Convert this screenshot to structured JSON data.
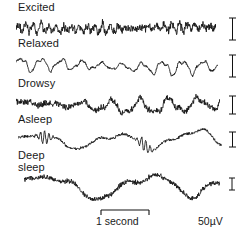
{
  "figure": {
    "width": 248,
    "height": 236,
    "background": "#ffffff",
    "trace_color": "#121212"
  },
  "traces": [
    {
      "label": "Excited",
      "state": "excited",
      "label_x": 18,
      "label_y": 2,
      "trace_x": 16,
      "trace_y": 18,
      "trace_width": 200,
      "trace_height": 20,
      "amplitude": 3.0,
      "frequency": 26,
      "noise": 1.9,
      "seed": 11,
      "rhythm": "beta",
      "description": "low-voltage fast beta activity",
      "vbar": {
        "x": 228,
        "y": 17,
        "height": 22,
        "cap_width": 7
      }
    },
    {
      "label": "Relaxed",
      "state": "relaxed",
      "label_x": 18,
      "label_y": 38,
      "trace_x": 16,
      "trace_y": 54,
      "trace_width": 202,
      "trace_height": 24,
      "amplitude": 8.0,
      "frequency": 10,
      "noise": 0.9,
      "seed": 27,
      "rhythm": "alpha",
      "description": "regular alpha rhythm",
      "vbar": {
        "x": 228,
        "y": 54,
        "height": 22,
        "cap_width": 7
      }
    },
    {
      "label": "Drowsy",
      "state": "drowsy",
      "label_x": 18,
      "label_y": 78,
      "trace_x": 16,
      "trace_y": 93,
      "trace_width": 204,
      "trace_height": 24,
      "amplitude": 5.0,
      "frequency": 7,
      "noise": 1.3,
      "seed": 43,
      "rhythm": "theta",
      "description": "mixed theta with waning alpha",
      "vbar": {
        "x": 228,
        "y": 95,
        "height": 18,
        "cap_width": 7
      }
    },
    {
      "label": "Asleep",
      "state": "asleep",
      "label_x": 18,
      "label_y": 114,
      "trace_x": 18,
      "trace_y": 126,
      "trace_width": 204,
      "trace_height": 28,
      "amplitude": 6.0,
      "frequency": 2.6,
      "noise": 0.8,
      "seed": 61,
      "rhythm": "spindles",
      "description": "slow waves with sleep spindles",
      "spindles": [
        0.13,
        0.62
      ],
      "vbar": {
        "x": 228,
        "y": 131,
        "height": 15,
        "cap_width": 7
      }
    },
    {
      "label": "Deep\nsleep",
      "state": "deep-sleep",
      "label_x": 18,
      "label_y": 150,
      "trace_x": 24,
      "trace_y": 168,
      "trace_width": 196,
      "trace_height": 34,
      "amplitude": 11.5,
      "frequency": 2.0,
      "noise": 1.5,
      "seed": 83,
      "rhythm": "delta",
      "description": "high-voltage slow delta waves",
      "vbar": {
        "x": 228,
        "y": 177,
        "height": 12,
        "cap_width": 6
      }
    }
  ],
  "scales": {
    "time": {
      "caption": "1 second",
      "bar_x": 100,
      "bar_y": 209,
      "bar_length": 48,
      "tick_height": 5,
      "caption_x": 96,
      "caption_y": 215
    },
    "voltage": {
      "caption": "50µV",
      "caption_x": 198,
      "caption_y": 215
    }
  }
}
